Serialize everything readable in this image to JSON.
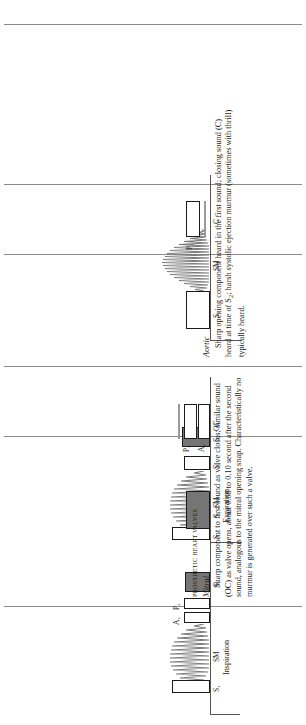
{
  "figure": {
    "panels": [
      {
        "id": "mitral-phono",
        "name": "mitral-prosthesis-phonocardiogram",
        "cycles": [
          {
            "phase_label": "Inspiration",
            "events": [
              {
                "label": "S1",
                "text": "S₁",
                "type": "open-bar"
              },
              {
                "label": "SM",
                "text": "SM",
                "type": "murmur"
              },
              {
                "label": "A2",
                "text": "A₂",
                "type": "open-bar"
              },
              {
                "label": "P2",
                "text": "P₂",
                "type": "open-bar"
              },
              {
                "label": "S3",
                "text": "S₃",
                "type": "filled-bar"
              }
            ]
          },
          {
            "phase_label": "Expiration",
            "events": [
              {
                "label": "S1",
                "text": "S₁",
                "type": "open-bar"
              },
              {
                "label": "SM",
                "text": "SM",
                "type": "murmur"
              },
              {
                "label": "S2",
                "text": "S₂",
                "type": "open-bar"
              },
              {
                "label": "S3",
                "text": "S₃",
                "type": "filled-bar"
              }
            ]
          }
        ]
      },
      {
        "id": "oc-phono",
        "name": "opening-click-phonocardiogram",
        "events": [
          {
            "label": "S1",
            "text": "S₁",
            "type": "filled-bar"
          },
          {
            "label": "A2",
            "text": "A₂",
            "type": "open-bar"
          },
          {
            "label": "P2",
            "text": "P₂",
            "type": "open-bar"
          },
          {
            "label": "OC",
            "text": "OC",
            "type": "open-bar"
          }
        ]
      },
      {
        "id": "aortic-phono",
        "name": "aortic-prosthesis-phonocardiogram",
        "events": [
          {
            "label": "S1",
            "text": "S₁",
            "type": "open-bar"
          },
          {
            "label": "SM",
            "text": "SM",
            "type": "murmur"
          },
          {
            "label": "P2",
            "text": "P₂",
            "type": "open-bar"
          },
          {
            "label": "C",
            "text": "C",
            "type": "open-bar"
          }
        ]
      }
    ]
  },
  "section": {
    "heading": "PROSTHETIC HEART VALVES",
    "mitral": {
      "subhead": "Mitral",
      "body": "Sharp component to first sound as valve closes; similar sound (OC) as valve opens, about 0.08 to 0.10 second after the second sound, analogous to the mitral opening snap. Characteristically no murmur is generated over such a valve."
    },
    "aortic": {
      "subhead": "Aortic",
      "body_line1": "Sharp opening component heard in the first sound; closing sound",
      "body_line2_pre": "(C) heard at time of S",
      "body_line2_sub": "2",
      "body_line2_post": "; harsh systolic ejection murmur",
      "body_line3": "(sometimes with thrill) typically heard."
    }
  },
  "colors": {
    "ink": "#1a1a1a",
    "rule": "#8a8a8a",
    "baseline": "#555555",
    "filled_bar": "#757575",
    "murmur": "#7a7a7a"
  }
}
